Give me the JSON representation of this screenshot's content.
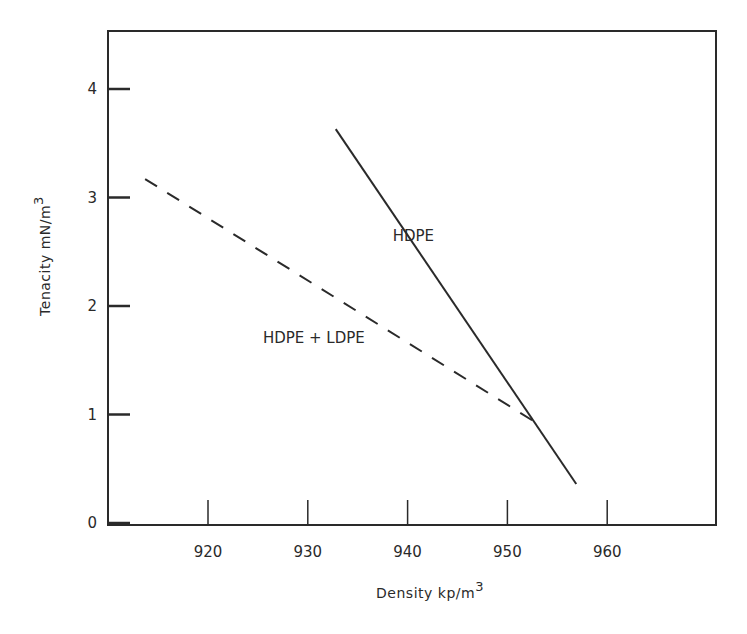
{
  "chart_data": {
    "type": "line",
    "title": "",
    "xlabel": "Density kp/m3",
    "ylabel": "Tenacity mN/m3",
    "xlabel_main": "Density  kp/m",
    "xlabel_sup": "3",
    "ylabel_main": "Tenacity   mN/m",
    "ylabel_sup": "3",
    "xlim": [
      910,
      970
    ],
    "ylim": [
      0,
      4.5
    ],
    "x_ticks": [
      920,
      930,
      940,
      950,
      960
    ],
    "y_ticks": [
      0,
      1,
      2,
      3,
      4
    ],
    "grid": false,
    "legend": "inline labels",
    "series": [
      {
        "name": "HDPE",
        "style": "solid",
        "x": [
          932.8,
          956.9
        ],
        "y": [
          3.63,
          0.36
        ],
        "label_pos": [
          938.5,
          2.6
        ]
      },
      {
        "name": "HDPE + LDPE",
        "style": "dashed",
        "x": [
          913.7,
          952.6
        ],
        "y": [
          3.17,
          0.94
        ],
        "label_pos": [
          925.5,
          1.66
        ]
      }
    ]
  }
}
